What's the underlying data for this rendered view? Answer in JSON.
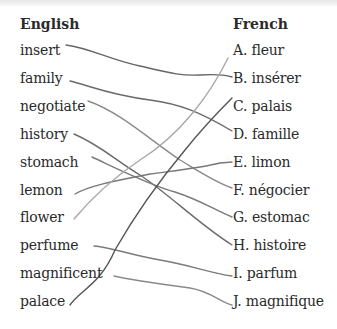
{
  "exercise": {
    "left_header": "English",
    "right_header": "French",
    "english": [
      "insert",
      "family",
      "negotiate",
      "history",
      "stomach",
      "lemon",
      "flower",
      "perfume",
      "magnificent",
      "palace"
    ],
    "french": [
      "A. fleur",
      "B. insérer",
      "C. palais",
      "D. famille",
      "E. limon",
      "F. négocier",
      "G. estomac",
      "H. histoire",
      "I. parfum",
      "J. magnifique"
    ],
    "matches": [
      {
        "english": "insert",
        "french": "B. insérer"
      },
      {
        "english": "family",
        "french": "D. famille"
      },
      {
        "english": "negotiate",
        "french": "F. négocier"
      },
      {
        "english": "history",
        "french": "H. histoire"
      },
      {
        "english": "stomach",
        "french": "G. estomac"
      },
      {
        "english": "lemon",
        "french": "E. limon"
      },
      {
        "english": "flower",
        "french": "A. fleur"
      },
      {
        "english": "perfume",
        "french": "I. parfum"
      },
      {
        "english": "magnificent",
        "french": "J. magnifique"
      },
      {
        "english": "palace",
        "french": "C. palais"
      }
    ]
  },
  "colors": {
    "line_dark": "#6a6a6a",
    "line_light": "#9a9a9a",
    "text": "#2a2a2a"
  }
}
